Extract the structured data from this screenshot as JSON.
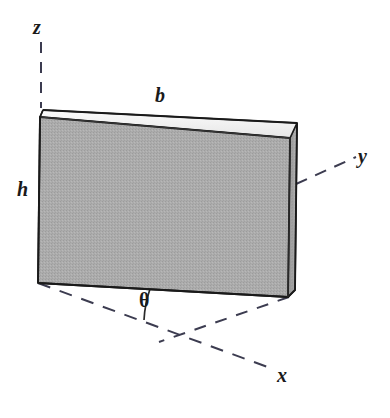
{
  "figure": {
    "type": "3d-rectangular-slab-with-coordinate-axes",
    "background_color": "#ffffff",
    "line_color": "#1a1a1a",
    "dash_color": "#3c3c50",
    "front_face_color": "#a9a9a9",
    "top_face_color": "#f2f2f2",
    "side_face_color": "#9a9a9a",
    "axes": [
      {
        "name": "z",
        "label": "z",
        "style": "dashed",
        "direction": "vertical-up"
      },
      {
        "name": "y",
        "label": "y",
        "style": "dashed",
        "direction": "upper-right"
      },
      {
        "name": "x",
        "label": "x",
        "style": "dashed",
        "direction": "lower-right"
      }
    ],
    "dimensions": [
      {
        "name": "b",
        "label": "b",
        "meaning": "width of plate",
        "position": "top-edge"
      },
      {
        "name": "h",
        "label": "h",
        "meaning": "height of plate",
        "position": "left-edge"
      }
    ],
    "angles": [
      {
        "name": "theta",
        "label": "θ",
        "meaning": "angle between x axis and base of plate"
      }
    ],
    "geometry": {
      "front_face": "40,117 290,138 288,297 38,283",
      "top_face": "40,117 43,110 297,123 290,138",
      "right_face": "290,138 297,123 295,290 288,297",
      "z_axis": {
        "x1": 41,
        "y1": 42,
        "x2": 41,
        "y2": 107
      },
      "y_axis": {
        "x1": 297,
        "y1": 183,
        "x2": 355,
        "y2": 157
      },
      "x_axis": {
        "x1": 38,
        "y1": 283,
        "x2": 272,
        "y2": 368
      },
      "corner_projection": {
        "x1": 288,
        "y1": 297,
        "x2": 160,
        "y2": 341
      },
      "theta_arc": {
        "cx": 38,
        "cy": 283,
        "r": 112,
        "from_deg": 18.8,
        "to_deg": 3.2
      }
    }
  }
}
